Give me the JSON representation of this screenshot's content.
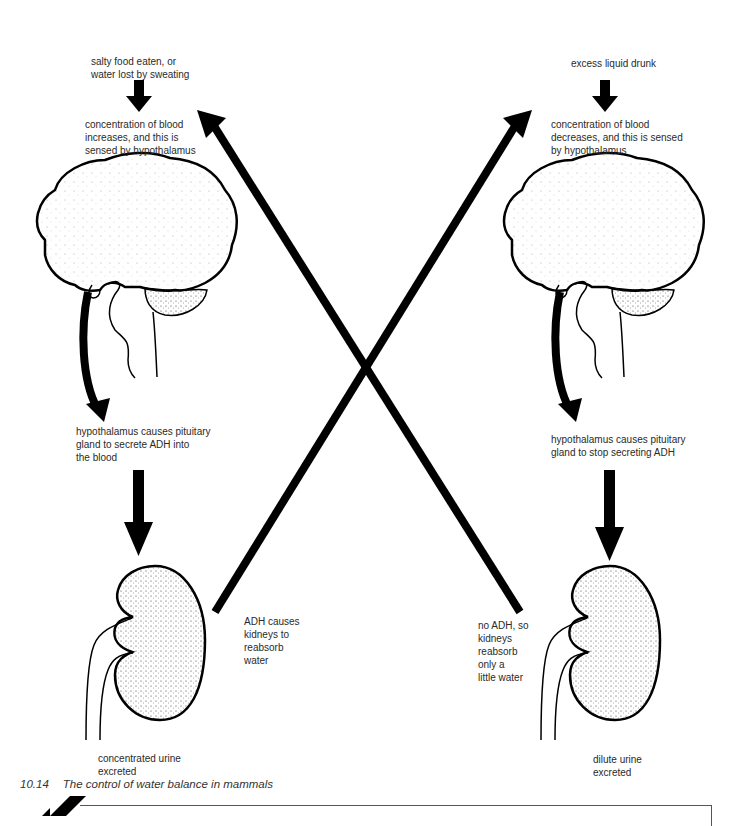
{
  "left": {
    "trigger": "salty food eaten, or\nwater lost by sweating",
    "sensing": "concentration of blood\nincreases, and this is\nsensed by hypothalamus",
    "pituitary": "hypothalamus causes pituitary\ngland to secrete ADH into\nthe blood",
    "kidney_action": "ADH causes\nkidneys to\nreabsorb\nwater",
    "outcome": "concentrated urine\nexcreted"
  },
  "right": {
    "trigger": "excess liquid drunk",
    "sensing": "concentration of blood\ndecreases, and this is sensed\nby hypothalamus",
    "pituitary": "hypothalamus causes pituitary\ngland to stop secreting ADH",
    "kidney_action": "no ADH, so\nkidneys\nreabsorb\nonly a\nlittle water",
    "outcome": "dilute urine\nexcreted"
  },
  "caption": {
    "number": "10.14",
    "text": "The control of water balance in mammals"
  },
  "icons": {
    "brain": "brain-illustration",
    "kidney": "kidney-illustration",
    "arrow": "black-arrow"
  },
  "colors": {
    "ink": "#000000",
    "text": "#2a2a2a",
    "background": "#ffffff"
  }
}
